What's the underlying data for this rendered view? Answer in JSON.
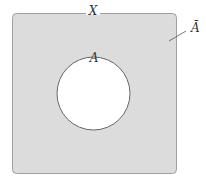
{
  "diagram": {
    "type": "venn",
    "universe_label": "X",
    "set_label": "A",
    "complement_label": "Ā",
    "colors": {
      "universe_fill": "#dcdcdc",
      "universe_stroke": "#999999",
      "set_fill": "#ffffff",
      "set_stroke": "#666666"
    }
  }
}
